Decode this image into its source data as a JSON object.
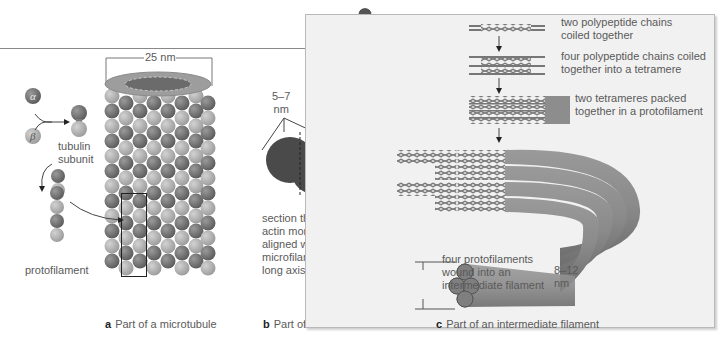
{
  "figure": {
    "panels": [
      {
        "id": "a",
        "caption_letter": "a",
        "caption_text": "Part of a microtubule",
        "labels": {
          "diameter": "25 nm",
          "alpha": "α",
          "beta": "β",
          "tubulin_subunit": "tubulin subunit",
          "tubulin_line1": "tubulin",
          "tubulin_line2": "subunit",
          "protofilament": "protofilament"
        }
      },
      {
        "id": "b",
        "caption_letter": "b",
        "caption_text": "Part of a microfilament",
        "labels": {
          "size_line1": "5–7",
          "size_line2": "nm",
          "section_lines": [
            "section through",
            "actin monomer,",
            "aligned with",
            "microfilament's",
            "long axis"
          ]
        }
      },
      {
        "id": "c",
        "caption_letter": "c",
        "caption_text": "Part of an intermediate filament",
        "steps": [
          {
            "lines": [
              "two polypeptide chains",
              "coiled together"
            ]
          },
          {
            "lines": [
              "four polypeptide chains coiled",
              "together into a tetramere"
            ]
          },
          {
            "lines": [
              "two tetrameres packed",
              "together in a protofilament"
            ]
          },
          {
            "lines": [
              "four protofilaments",
              "wound into an",
              "intermediate filament"
            ]
          }
        ],
        "size_line1": "8–12",
        "size_line2": "nm"
      }
    ],
    "colors": {
      "alpha_tubulin": "#6e6e6e",
      "beta_tubulin": "#a9a9a9",
      "actin": "#4a4a4a",
      "panel_c_bg": "#f1f1f1",
      "filament": "#8a8a8a"
    }
  }
}
